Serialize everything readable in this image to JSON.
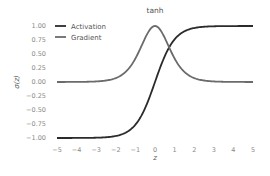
{
  "chart_data": {
    "type": "line",
    "title": "tanh",
    "xlabel": "z",
    "ylabel": "σ(z)",
    "xlim": [
      -5,
      5
    ],
    "ylim": [
      -1.0,
      1.0
    ],
    "grid": false,
    "legend_position": "upper left",
    "x_ticks": [
      "−5",
      "−4",
      "−3",
      "−2",
      "−1",
      "0",
      "1",
      "2",
      "3",
      "4",
      "5"
    ],
    "y_ticks": [
      "1.00",
      "0.75",
      "0.50",
      "0.25",
      "0.00",
      "−0.25",
      "−0.50",
      "−0.75",
      "−1.00"
    ],
    "series": [
      {
        "name": "Activation",
        "function": "tanh(z)",
        "color": "#2b2b2b",
        "x": [
          -5,
          -4,
          -3,
          -2,
          -1,
          0,
          1,
          2,
          3,
          4,
          5
        ],
        "values": [
          -1.0,
          -0.999,
          -0.995,
          -0.964,
          -0.762,
          0.0,
          0.762,
          0.964,
          0.995,
          0.999,
          1.0
        ]
      },
      {
        "name": "Gradient",
        "function": "1 - tanh(z)^2",
        "color": "#6b6b6b",
        "x": [
          -5,
          -4,
          -3,
          -2,
          -1,
          0,
          1,
          2,
          3,
          4,
          5
        ],
        "values": [
          0.0002,
          0.0013,
          0.0099,
          0.0707,
          0.42,
          1.0,
          0.42,
          0.0707,
          0.0099,
          0.0013,
          0.0002
        ]
      }
    ]
  }
}
